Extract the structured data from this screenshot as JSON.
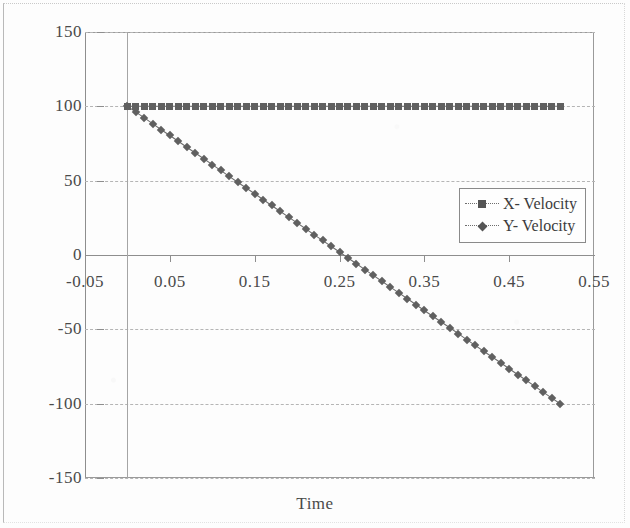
{
  "chart_data": {
    "type": "line",
    "title": "",
    "xlabel": "Time",
    "ylabel": "",
    "xlim": [
      -0.05,
      0.55
    ],
    "ylim": [
      -150,
      150
    ],
    "grid": true,
    "legend_position": "inside-right",
    "xticks": [
      "-0.05",
      "0.05",
      "0.15",
      "0.25",
      "0.35",
      "0.45",
      "0.55"
    ],
    "xtick_values": [
      -0.05,
      0.05,
      0.15,
      0.25,
      0.35,
      0.45,
      0.55
    ],
    "yticks": [
      "150",
      "100",
      "50",
      "0",
      "-50",
      "-100",
      "-150"
    ],
    "ytick_values": [
      150,
      100,
      50,
      0,
      -50,
      -100,
      -150
    ],
    "series": [
      {
        "name": "X- Velocity",
        "marker": "square",
        "color": "#606060",
        "x": [
          0,
          0.01,
          0.02,
          0.03,
          0.04,
          0.05,
          0.06,
          0.07,
          0.08,
          0.09,
          0.1,
          0.11,
          0.12,
          0.13,
          0.14,
          0.15,
          0.16,
          0.17,
          0.18,
          0.19,
          0.2,
          0.21,
          0.22,
          0.23,
          0.24,
          0.25,
          0.26,
          0.27,
          0.28,
          0.29,
          0.3,
          0.31,
          0.32,
          0.33,
          0.34,
          0.35,
          0.36,
          0.37,
          0.38,
          0.39,
          0.4,
          0.41,
          0.42,
          0.43,
          0.44,
          0.45,
          0.46,
          0.47,
          0.48,
          0.49,
          0.5,
          0.51
        ],
        "values": [
          100,
          100,
          100,
          100,
          100,
          100,
          100,
          100,
          100,
          100,
          100,
          100,
          100,
          100,
          100,
          100,
          100,
          100,
          100,
          100,
          100,
          100,
          100,
          100,
          100,
          100,
          100,
          100,
          100,
          100,
          100,
          100,
          100,
          100,
          100,
          100,
          100,
          100,
          100,
          100,
          100,
          100,
          100,
          100,
          100,
          100,
          100,
          100,
          100,
          100,
          100,
          100
        ]
      },
      {
        "name": "Y- Velocity",
        "marker": "diamond",
        "color": "#606060",
        "x": [
          0,
          0.01,
          0.02,
          0.03,
          0.04,
          0.05,
          0.06,
          0.07,
          0.08,
          0.09,
          0.1,
          0.11,
          0.12,
          0.13,
          0.14,
          0.15,
          0.16,
          0.17,
          0.18,
          0.19,
          0.2,
          0.21,
          0.22,
          0.23,
          0.24,
          0.25,
          0.26,
          0.27,
          0.28,
          0.29,
          0.3,
          0.31,
          0.32,
          0.33,
          0.34,
          0.35,
          0.36,
          0.37,
          0.38,
          0.39,
          0.4,
          0.41,
          0.42,
          0.43,
          0.44,
          0.45,
          0.46,
          0.47,
          0.48,
          0.49,
          0.5,
          0.51
        ],
        "values": [
          100,
          96.1,
          92.2,
          88.2,
          84.3,
          80.4,
          76.5,
          72.5,
          68.6,
          64.7,
          60.8,
          56.9,
          52.9,
          49.0,
          45.1,
          41.2,
          37.3,
          33.3,
          29.4,
          25.5,
          21.6,
          17.6,
          13.7,
          9.8,
          5.9,
          2.0,
          -2.0,
          -5.9,
          -9.8,
          -13.7,
          -17.6,
          -21.6,
          -25.5,
          -29.4,
          -33.3,
          -37.3,
          -41.2,
          -45.1,
          -49.0,
          -52.9,
          -56.9,
          -60.8,
          -64.7,
          -68.6,
          -72.5,
          -76.5,
          -80.4,
          -84.3,
          -88.2,
          -92.2,
          -96.1,
          -100
        ]
      }
    ]
  },
  "legend": {
    "entries": [
      {
        "label": "X- Velocity",
        "marker": "square"
      },
      {
        "label": "Y- Velocity",
        "marker": "diamond"
      }
    ]
  },
  "axis": {
    "x_title": "Time"
  }
}
